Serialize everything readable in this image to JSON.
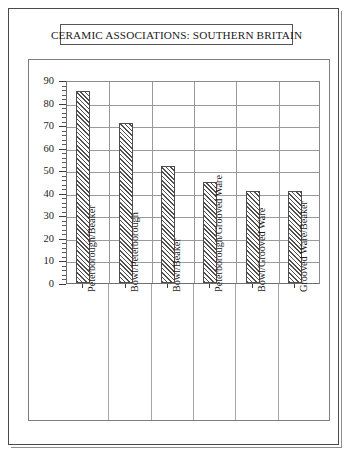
{
  "title": "CERAMIC ASSOCIATIONS:  SOUTHERN BRITAIN",
  "chart_data": {
    "type": "bar",
    "title": "CERAMIC ASSOCIATIONS:  SOUTHERN BRITAIN",
    "xlabel": "",
    "ylabel": "",
    "ylim": [
      0,
      90
    ],
    "ytick_step": 10,
    "yminor_step": 2,
    "grid": true,
    "legend": "none",
    "categories": [
      "Peterborough/Beaker",
      "Bowl/Peterborough",
      "Bowl/Beaker",
      "Peterborough/Grooved Ware",
      "Bowl/Grooved Ware",
      "Grooved Ware/Beaker"
    ],
    "values": [
      85,
      71,
      52,
      45,
      41,
      41
    ],
    "ytick_labels": [
      "0",
      "10",
      "20",
      "30",
      "40",
      "50",
      "60",
      "70",
      "80",
      "90"
    ],
    "bar_style": {
      "fill": "diagonal-hatch",
      "hatch_color": "#4f4f4f",
      "edge_color": "#4d4d4d",
      "background": "#fdfdfd"
    }
  }
}
